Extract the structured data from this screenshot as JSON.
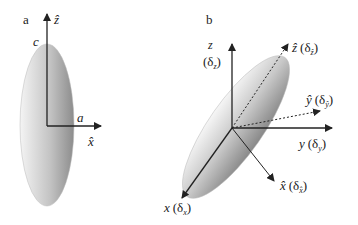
{
  "panels": {
    "a": {
      "label": "a",
      "axis_z": "ẑ",
      "axis_x": "x̂",
      "semi_axis_c": "c",
      "semi_axis_a": "a"
    },
    "b": {
      "label": "b",
      "axis_z": "z",
      "axis_z_delta": "(δ",
      "axis_z_sub": "z",
      "axis_zhat": "ẑ",
      "axis_zhat_delta": "(δ",
      "axis_zhat_sub": "ẑ",
      "axis_yhat": "ŷ",
      "axis_yhat_delta": "(δ",
      "axis_yhat_sub": "ŷ",
      "axis_y": "y",
      "axis_y_delta": "(δ",
      "axis_y_sub": "y",
      "axis_xhat": "x̂",
      "axis_xhat_delta": "(δ",
      "axis_xhat_sub": "x̂",
      "axis_x": "x",
      "axis_x_delta": "(δ",
      "axis_x_sub": "x",
      "close_paren": ")"
    }
  },
  "colors": {
    "axis": "#222222",
    "ellipse_light": "#f2f2f2",
    "ellipse_dark": "#8a8a8a"
  }
}
